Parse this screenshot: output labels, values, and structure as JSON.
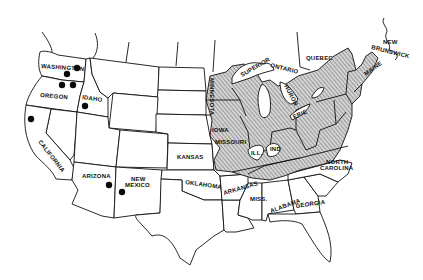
{
  "map": {
    "title": "",
    "region": "United States and southeastern Canada",
    "legend": {
      "hatched_area": "range region (eastern/central US)",
      "dots": "occurrence points (western US)"
    },
    "labels": {
      "washington": "WASHINGTON",
      "oregon": "OREGON",
      "idaho": "IDAHO",
      "california": "CALIFORNIA",
      "arizona": "ARIZONA",
      "new_mexico_1": "NEW",
      "new_mexico_2": "MEXICO",
      "kansas": "KANSAS",
      "oklahoma": "OKLAHOMA",
      "arkansas": "ARKANSAS",
      "iowa": "IOWA",
      "missouri": "MISSOURI",
      "minnesota": "MINNESOTA",
      "illinois": "ILL.",
      "indiana": "IND",
      "mississippi": "MISS.",
      "alabama": "ALABAMA",
      "georgia": "GEORGIA",
      "north_carolina_1": "NORTH",
      "north_carolina_2": "CAROLINA",
      "superior": "SUPERIOR",
      "ontario": "ONTARIO",
      "huron": "HURON",
      "erie": "ERIE",
      "quebec": "QUEBEC",
      "new_brunswick_1": "NEW",
      "new_brunswick_2": "BRUNSWICK",
      "maine": "MAINE"
    },
    "colors": {
      "ink": "#111111",
      "background": "#ffffff",
      "hatch_fill": "#cfcfcf"
    },
    "dots": [
      {
        "state": "WASHINGTON",
        "x": 77,
        "y": 68
      },
      {
        "state": "WASHINGTON",
        "x": 67,
        "y": 74
      },
      {
        "state": "OREGON",
        "x": 62,
        "y": 85
      },
      {
        "state": "OREGON",
        "x": 73,
        "y": 85
      },
      {
        "state": "IDAHO",
        "x": 85,
        "y": 106
      },
      {
        "state": "CALIFORNIA",
        "x": 31,
        "y": 119
      },
      {
        "state": "ARIZONA",
        "x": 109,
        "y": 185
      },
      {
        "state": "NEW MEXICO",
        "x": 122,
        "y": 192
      }
    ]
  }
}
